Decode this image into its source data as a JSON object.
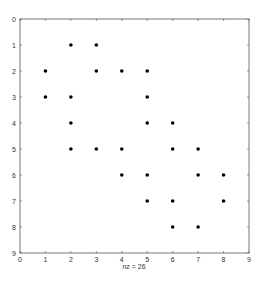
{
  "chart_data": {
    "type": "scatter",
    "subtype": "spy",
    "title": "",
    "xlabel": "nz = 26",
    "ylabel": "",
    "xlim": [
      0,
      9
    ],
    "ylim": [
      9,
      0
    ],
    "y_reversed": true,
    "grid": false,
    "xticks": [
      "0",
      "1",
      "2",
      "3",
      "4",
      "5",
      "6",
      "7",
      "8",
      "9"
    ],
    "yticks": [
      "0",
      "1",
      "2",
      "3",
      "4",
      "5",
      "6",
      "7",
      "8",
      "9"
    ],
    "nz": 26,
    "points": [
      {
        "x": 2,
        "y": 1
      },
      {
        "x": 3,
        "y": 1
      },
      {
        "x": 1,
        "y": 2
      },
      {
        "x": 3,
        "y": 2
      },
      {
        "x": 4,
        "y": 2
      },
      {
        "x": 5,
        "y": 2
      },
      {
        "x": 1,
        "y": 3
      },
      {
        "x": 2,
        "y": 3
      },
      {
        "x": 5,
        "y": 3
      },
      {
        "x": 2,
        "y": 4
      },
      {
        "x": 5,
        "y": 4
      },
      {
        "x": 6,
        "y": 4
      },
      {
        "x": 2,
        "y": 5
      },
      {
        "x": 3,
        "y": 5
      },
      {
        "x": 4,
        "y": 5
      },
      {
        "x": 6,
        "y": 5
      },
      {
        "x": 7,
        "y": 5
      },
      {
        "x": 4,
        "y": 6
      },
      {
        "x": 5,
        "y": 6
      },
      {
        "x": 7,
        "y": 6
      },
      {
        "x": 8,
        "y": 6
      },
      {
        "x": 5,
        "y": 7
      },
      {
        "x": 6,
        "y": 7
      },
      {
        "x": 8,
        "y": 7
      },
      {
        "x": 6,
        "y": 8
      },
      {
        "x": 7,
        "y": 8
      }
    ],
    "marker_color": "#000000",
    "axis_color": "#555555"
  }
}
